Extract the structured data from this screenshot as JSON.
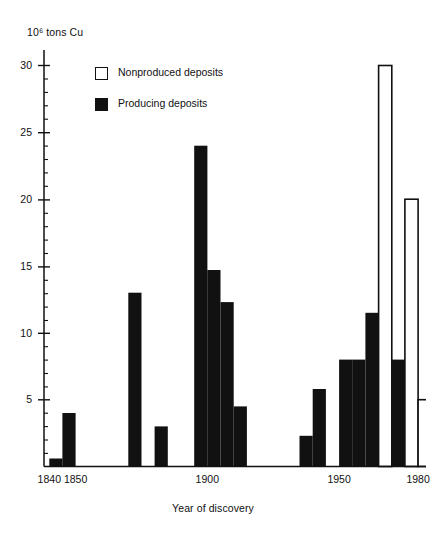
{
  "chart_data": {
    "type": "bar",
    "title": "10⁶ tons Cu",
    "xlabel": "Year of discovery",
    "ylabel": "10⁶ tons Cu",
    "xlim": [
      1838,
      1983
    ],
    "ylim": [
      0,
      31
    ],
    "grid": false,
    "bin_width": 5,
    "legend_position": "upper-left-inside",
    "legend": [
      {
        "key": "nonproduced",
        "label": "Nonproduced deposits",
        "swatch": "hollow",
        "color": "#ffffff",
        "edge": "#111111"
      },
      {
        "key": "producing",
        "label": "Producing deposits",
        "swatch": "filled",
        "color": "#111111",
        "edge": "#111111"
      }
    ],
    "y_ticks_major": [
      5,
      10,
      15,
      20,
      25,
      30
    ],
    "y_ticks_minor": [
      1,
      2,
      3,
      4,
      6,
      7,
      8,
      9,
      11,
      12,
      13,
      14,
      16,
      17,
      18,
      19,
      21,
      22,
      23,
      24,
      26,
      27,
      28,
      29
    ],
    "x_ticks": [
      1840,
      1850,
      1900,
      1950,
      1980
    ],
    "x_tick_labels": [
      "1840",
      "1850",
      "1900",
      "1950",
      "1980"
    ],
    "series": [
      {
        "name": "Producing deposits",
        "color": "#111111",
        "bins": [
          {
            "x0": 1840,
            "x1": 1845,
            "value": 0.6
          },
          {
            "x0": 1845,
            "x1": 1850,
            "value": 4.0
          },
          {
            "x0": 1870,
            "x1": 1875,
            "value": 13.0
          },
          {
            "x0": 1880,
            "x1": 1885,
            "value": 3.0
          },
          {
            "x0": 1895,
            "x1": 1900,
            "value": 24.0
          },
          {
            "x0": 1900,
            "x1": 1905,
            "value": 14.7
          },
          {
            "x0": 1905,
            "x1": 1910,
            "value": 12.3
          },
          {
            "x0": 1910,
            "x1": 1915,
            "value": 4.5
          },
          {
            "x0": 1935,
            "x1": 1940,
            "value": 2.3
          },
          {
            "x0": 1940,
            "x1": 1945,
            "value": 5.8
          },
          {
            "x0": 1950,
            "x1": 1955,
            "value": 8.0
          },
          {
            "x0": 1955,
            "x1": 1960,
            "value": 8.0
          },
          {
            "x0": 1960,
            "x1": 1965,
            "value": 11.5
          },
          {
            "x0": 1970,
            "x1": 1975,
            "value": 8.0
          }
        ]
      },
      {
        "name": "Nonproduced deposits",
        "color": "#ffffff",
        "bins": [
          {
            "x0": 1965,
            "x1": 1970,
            "value": 30.0,
            "base": 0.0
          },
          {
            "x0": 1975,
            "x1": 1980,
            "value": 20.0,
            "base": 0.0
          },
          {
            "x0": 1980,
            "x1": 1984,
            "value": 5.0,
            "base": 0.0
          }
        ]
      }
    ]
  },
  "axis": {
    "y_title": "10⁶ tons Cu",
    "x_title": "Year of discovery",
    "y_labels": [
      "30",
      "25",
      "20",
      "15",
      "10",
      "5"
    ],
    "x_labels": [
      "1840",
      "1850",
      "1900",
      "1950",
      "1980"
    ]
  },
  "legend": {
    "nonproduced_label": "Nonproduced deposits",
    "producing_label": "Producing deposits"
  }
}
